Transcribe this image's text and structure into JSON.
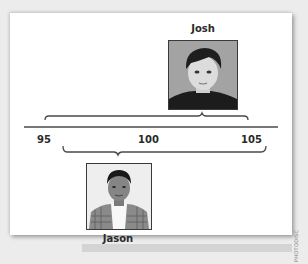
{
  "figure": {
    "number_line": {
      "min": 95,
      "max": 105,
      "tick_labels": [
        "95",
        "100",
        "105"
      ]
    },
    "people": [
      {
        "name": "Josh",
        "position": "above-line",
        "photo_description": "grayscale portrait of a boy with dark hair, dark shirt, gray background"
      },
      {
        "name": "Jason",
        "position": "below-line",
        "photo_description": "grayscale portrait of a boy with short dark hair, plaid shirt over white t-shirt, light background"
      }
    ],
    "credit": "PHOTODISC"
  },
  "colors": {
    "background": "#ececec",
    "card": "#ffffff",
    "line": "#4a4a4a",
    "text": "#2a2a2a"
  }
}
